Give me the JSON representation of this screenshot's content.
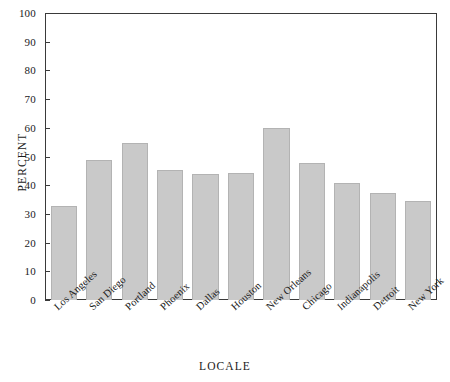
{
  "chart_data": {
    "type": "bar",
    "title": "",
    "xlabel": "LOCALE",
    "ylabel": "PERCENT",
    "ylim": [
      0,
      100
    ],
    "yticks": [
      0,
      10,
      20,
      30,
      40,
      50,
      60,
      70,
      80,
      90,
      100
    ],
    "grid": false,
    "legend": null,
    "bar_color": "#c9c9c9",
    "bar_edge_color": "#b3b3b3",
    "axis_color": "#3a3a3a",
    "categories": [
      "Los Angeles",
      "San Diego",
      "Portland",
      "Phoenix",
      "Dallas",
      "Houston",
      "New Orleans",
      "Chicago",
      "Indianapolis",
      "Detroit",
      "New York"
    ],
    "values": [
      33,
      49,
      55,
      45.5,
      44,
      44.5,
      60,
      48,
      41,
      37.5,
      34.5
    ]
  }
}
